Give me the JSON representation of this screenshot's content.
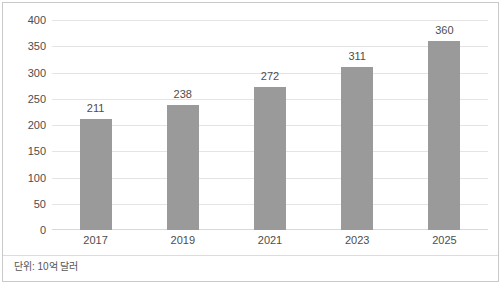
{
  "chart_data": {
    "type": "bar",
    "title": "",
    "subtitle": "",
    "xlabel": "",
    "ylabel": "",
    "categories": [
      "2017",
      "2019",
      "2021",
      "2023",
      "2025"
    ],
    "values": [
      211,
      238,
      272,
      311,
      360
    ],
    "data_labels": [
      "211",
      "238",
      "272",
      "311",
      "360"
    ],
    "ylim": [
      0,
      400
    ],
    "ytick_step": 50,
    "yticks": [
      "400",
      "350",
      "300",
      "250",
      "200",
      "150",
      "100",
      "50",
      "0"
    ],
    "ytick_values": [
      400,
      350,
      300,
      250,
      200,
      150,
      100,
      50,
      0
    ],
    "grid": true,
    "grid_axis": "y",
    "legend": false,
    "legend_position": "none",
    "series": [
      {
        "name": "",
        "values": [
          211,
          238,
          272,
          311,
          360
        ],
        "color": "#9a9a9a"
      }
    ],
    "annotations": {
      "footnote": "단위: 10억 달러"
    },
    "colors": {
      "bar": "#9a9a9a",
      "gridline": "#e4e4e4",
      "axis": "#d8d8d8",
      "text": "#4d4d4d",
      "footnote_text": "#555555",
      "frame": "#c9c9c9",
      "background": "#ffffff"
    }
  }
}
